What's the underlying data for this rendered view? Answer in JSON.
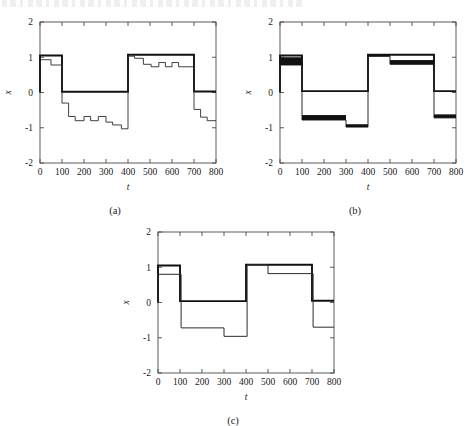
{
  "figure": {
    "panels": [
      {
        "id": "a",
        "caption": "(a)",
        "xlabel": "t",
        "ylabel": "x",
        "xlim": [
          0,
          800
        ],
        "ylim": [
          -2,
          2
        ],
        "xticks": [
          0,
          100,
          200,
          300,
          400,
          500,
          600,
          700,
          800
        ],
        "xticklabels": [
          "0",
          "100",
          "200",
          "300",
          "400",
          "500",
          "600",
          "700",
          "800"
        ],
        "yticks": [
          -2,
          -1,
          0,
          1,
          2
        ],
        "yticklabels": [
          "-2",
          "-1",
          "0",
          "1",
          "2"
        ],
        "grid": false,
        "legend": "none"
      },
      {
        "id": "b",
        "caption": "(b)",
        "xlabel": "t",
        "ylabel": "x",
        "xlim": [
          0,
          800
        ],
        "ylim": [
          -2,
          2
        ],
        "xticks": [
          0,
          100,
          200,
          300,
          400,
          500,
          600,
          700,
          800
        ],
        "xticklabels": [
          "0",
          "100",
          "200",
          "300",
          "400",
          "500",
          "600",
          "700",
          "800"
        ],
        "yticks": [
          -2,
          -1,
          0,
          1,
          2
        ],
        "yticklabels": [
          "-2",
          "-1",
          "0",
          "1",
          "2"
        ],
        "grid": false,
        "legend": "none"
      },
      {
        "id": "c",
        "caption": "(c)",
        "xlabel": "t",
        "ylabel": "x",
        "xlim": [
          0,
          800
        ],
        "ylim": [
          -2,
          2
        ],
        "xticks": [
          0,
          100,
          200,
          300,
          400,
          500,
          600,
          700,
          800
        ],
        "xticklabels": [
          "0",
          "100",
          "200",
          "300",
          "400",
          "500",
          "600",
          "700",
          "800"
        ],
        "yticks": [
          -2,
          -1,
          0,
          1,
          2
        ],
        "yticklabels": [
          "-2",
          "-1",
          "0",
          "1",
          "2"
        ],
        "grid": false,
        "legend": "none"
      }
    ]
  },
  "chart_data": [
    {
      "type": "line",
      "panel": "a",
      "title": "",
      "xlabel": "t",
      "ylabel": "x",
      "xlim": [
        0,
        800
      ],
      "ylim": [
        -2,
        2
      ],
      "grid": false,
      "legend": "none",
      "step": "post",
      "series": [
        {
          "name": "reference",
          "style": "thick",
          "width": 1.9,
          "color": "#111111",
          "x": [
            0,
            0,
            100,
            100,
            400,
            400,
            700,
            700,
            800
          ],
          "y": [
            0,
            1.05,
            1.05,
            0.02,
            0.02,
            1.07,
            1.07,
            0.03,
            0.03
          ]
        },
        {
          "name": "output",
          "style": "thin",
          "width": 0.9,
          "color": "#2b2b2b",
          "x": [
            0,
            0,
            50,
            50,
            100,
            100,
            130,
            130,
            160,
            160,
            200,
            200,
            230,
            230,
            265,
            265,
            300,
            300,
            330,
            330,
            370,
            370,
            400,
            400,
            430,
            430,
            470,
            470,
            505,
            505,
            540,
            540,
            570,
            570,
            600,
            600,
            630,
            630,
            660,
            660,
            700,
            700,
            730,
            730,
            760,
            760,
            800
          ],
          "y": [
            0,
            0.93,
            0.93,
            0.78,
            0.78,
            -0.3,
            -0.3,
            -0.68,
            -0.68,
            -0.8,
            -0.8,
            -0.68,
            -0.68,
            -0.8,
            -0.8,
            -0.68,
            -0.68,
            -0.84,
            -0.84,
            -0.92,
            -0.92,
            -1.03,
            -1.03,
            1.03,
            1.03,
            0.97,
            0.97,
            0.8,
            0.8,
            0.73,
            0.73,
            0.85,
            0.85,
            0.73,
            0.73,
            0.85,
            0.85,
            0.73,
            0.73,
            0.73,
            0.73,
            -0.48,
            -0.48,
            -0.7,
            -0.7,
            -0.8,
            -0.8
          ]
        }
      ]
    },
    {
      "type": "line",
      "panel": "b",
      "title": "",
      "xlabel": "t",
      "ylabel": "x",
      "xlim": [
        0,
        800
      ],
      "ylim": [
        -2,
        2
      ],
      "grid": false,
      "legend": "none",
      "step": "post",
      "series": [
        {
          "name": "reference",
          "style": "thick",
          "width": 1.9,
          "color": "#111111",
          "x": [
            0,
            0,
            100,
            100,
            400,
            400,
            700,
            700,
            800
          ],
          "y": [
            0,
            1.05,
            1.05,
            0.04,
            0.04,
            1.07,
            1.07,
            0.04,
            0.04
          ]
        },
        {
          "name": "output",
          "style": "thin",
          "width": 1.0,
          "color": "#2b2b2b",
          "x": [
            0,
            0,
            100,
            100,
            300,
            300,
            400,
            400,
            500,
            500,
            700,
            700,
            800
          ],
          "y": [
            0,
            0.78,
            0.78,
            -0.78,
            -0.78,
            -0.98,
            -0.98,
            1.03,
            1.03,
            0.8,
            0.8,
            -0.72,
            -0.72
          ]
        },
        {
          "name": "band-fill",
          "style": "band",
          "color": "#111111",
          "segments": [
            {
              "x0": 0,
              "x1": 100,
              "y0": 0.78,
              "y1": 1.0
            },
            {
              "x0": 100,
              "x1": 300,
              "y0": -0.78,
              "y1": -0.64
            },
            {
              "x0": 300,
              "x1": 400,
              "y0": -0.98,
              "y1": -0.9
            },
            {
              "x0": 400,
              "x1": 500,
              "y0": 1.02,
              "y1": 1.07
            },
            {
              "x0": 500,
              "x1": 700,
              "y0": 0.8,
              "y1": 0.92
            },
            {
              "x0": 700,
              "x1": 800,
              "y0": -0.72,
              "y1": -0.62
            }
          ]
        }
      ]
    },
    {
      "type": "line",
      "panel": "c",
      "title": "",
      "xlabel": "t",
      "ylabel": "x",
      "xlim": [
        0,
        800
      ],
      "ylim": [
        -2,
        2
      ],
      "grid": false,
      "legend": "none",
      "step": "post",
      "series": [
        {
          "name": "reference",
          "style": "thick",
          "width": 1.9,
          "color": "#111111",
          "x": [
            0,
            0,
            100,
            100,
            400,
            400,
            700,
            700,
            800
          ],
          "y": [
            0,
            1.05,
            1.05,
            0.04,
            0.04,
            1.07,
            1.07,
            0.05,
            0.05
          ]
        },
        {
          "name": "output",
          "style": "thin",
          "width": 1.0,
          "color": "#2b2b2b",
          "x": [
            0,
            0,
            105,
            105,
            300,
            300,
            405,
            405,
            500,
            500,
            705,
            705,
            800
          ],
          "y": [
            0,
            0.8,
            0.8,
            -0.72,
            -0.72,
            -0.96,
            -0.96,
            1.07,
            1.07,
            0.82,
            0.82,
            -0.7,
            -0.7
          ]
        }
      ]
    }
  ]
}
